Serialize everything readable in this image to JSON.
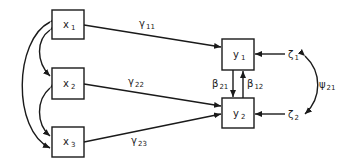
{
  "diagram": {
    "type": "path-diagram",
    "nodes": {
      "x1": {
        "base": "x",
        "sub": "1"
      },
      "x2": {
        "base": "x",
        "sub": "2"
      },
      "x3": {
        "base": "x",
        "sub": "3"
      },
      "y1": {
        "base": "y",
        "sub": "1"
      },
      "y2": {
        "base": "y",
        "sub": "2"
      },
      "zeta1": {
        "base": "ζ",
        "sub": "1"
      },
      "zeta2": {
        "base": "ζ",
        "sub": "2"
      }
    },
    "paths": {
      "gamma11": {
        "base": "γ",
        "sub": "11"
      },
      "gamma22": {
        "base": "γ",
        "sub": "22"
      },
      "gamma23": {
        "base": "γ",
        "sub": "23"
      },
      "beta21": {
        "base": "β",
        "sub": "21"
      },
      "beta12": {
        "base": "β",
        "sub": "12"
      },
      "psi21": {
        "base": "ψ",
        "sub": "21"
      }
    },
    "colors": {
      "stroke": "#1a1a1a",
      "background": "#ffffff"
    }
  }
}
